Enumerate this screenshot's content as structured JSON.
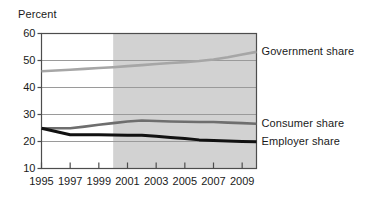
{
  "chart_data": {
    "type": "line",
    "title": "",
    "ylabel": "Percent",
    "xlabel": "",
    "ylim": [
      10,
      60
    ],
    "xlim": [
      1995,
      2010
    ],
    "ytick_values": [
      60,
      50,
      40,
      30,
      20,
      10
    ],
    "ytick_labels": [
      "60",
      "50",
      "40",
      "30",
      "20",
      "10"
    ],
    "xtick_values": [
      1995,
      1997,
      1999,
      2001,
      2003,
      2005,
      2007,
      2009
    ],
    "xtick_labels": [
      "1995",
      "1997",
      "1999",
      "2001",
      "2003",
      "2005",
      "2007",
      "2009"
    ],
    "grid": true,
    "grid_axis": "y",
    "legend_position": "right-inline",
    "shaded_region": {
      "label": "projected",
      "x_start": 2000,
      "x_end": 2010,
      "color": "#d2d2d2"
    },
    "x": [
      1995,
      1996,
      1997,
      1998,
      1999,
      2000,
      2001,
      2002,
      2003,
      2004,
      2005,
      2006,
      2007,
      2008,
      2009,
      2010
    ],
    "series": [
      {
        "name": "Government share",
        "color": "#a6a6a6",
        "width": 2.6,
        "values": [
          46.0,
          46.3,
          46.6,
          46.9,
          47.2,
          47.5,
          47.9,
          48.3,
          48.7,
          49.1,
          49.4,
          49.8,
          50.4,
          51.2,
          52.2,
          53.2
        ]
      },
      {
        "name": "Consumer share",
        "color": "#6e6e6e",
        "width": 2.6,
        "values": [
          24.9,
          24.9,
          24.9,
          25.5,
          26.2,
          26.8,
          27.4,
          27.8,
          27.6,
          27.4,
          27.3,
          27.2,
          27.2,
          27.0,
          26.8,
          26.6
        ]
      },
      {
        "name": "Employer share",
        "color": "#111111",
        "width": 3.0,
        "values": [
          24.9,
          23.7,
          22.5,
          22.5,
          22.5,
          22.4,
          22.3,
          22.3,
          21.9,
          21.5,
          21.1,
          20.6,
          20.4,
          20.2,
          20.0,
          19.9
        ]
      }
    ],
    "series_label_positions": [
      {
        "name": "Government share",
        "y_value": 53.2
      },
      {
        "name": "Consumer share",
        "y_value": 26.6
      },
      {
        "name": "Employer share",
        "y_value": 19.9
      }
    ]
  },
  "colors": {
    "background": "#ffffff",
    "text": "#1a1a1a",
    "axis": "#4d4d4d",
    "gridline": "#9a9a9a",
    "shade": "#d2d2d2"
  }
}
